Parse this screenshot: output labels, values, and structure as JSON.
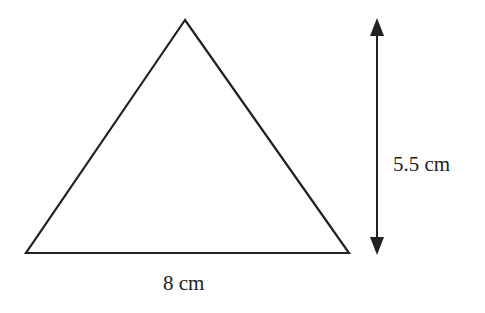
{
  "diagram": {
    "shape": "triangle",
    "base_label": "8 cm",
    "height_label": "5.5 cm",
    "stroke_color": "#222222",
    "background": "#ffffff"
  }
}
